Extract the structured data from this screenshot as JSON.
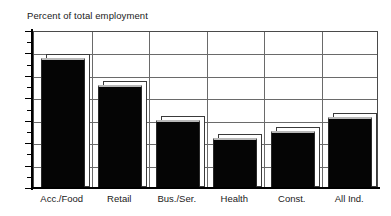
{
  "chart_data": {
    "type": "bar",
    "title": "Percent of total employment",
    "xlabel": "",
    "ylabel": "",
    "ylim": [
      0,
      70
    ],
    "ytick_step": 10,
    "yticks": [
      "0",
      "10",
      "20",
      "30",
      "40",
      "50",
      "60",
      "70"
    ],
    "grid": true,
    "legend": "none",
    "categories": [
      "Acc./Food",
      "Retail",
      "Bus./Ser.",
      "Health",
      "Const.",
      "All Ind."
    ],
    "values": [
      57.5,
      45.5,
      30,
      22,
      25,
      31
    ],
    "series": [
      {
        "name": "Percent of total employment",
        "values": [
          57.5,
          45.5,
          30,
          22,
          25,
          31
        ]
      }
    ],
    "bar_color": "#050505",
    "bar_top_color": "#b8b8b8",
    "axis_color": "#000000",
    "grid_color": "#6a6a6a"
  }
}
